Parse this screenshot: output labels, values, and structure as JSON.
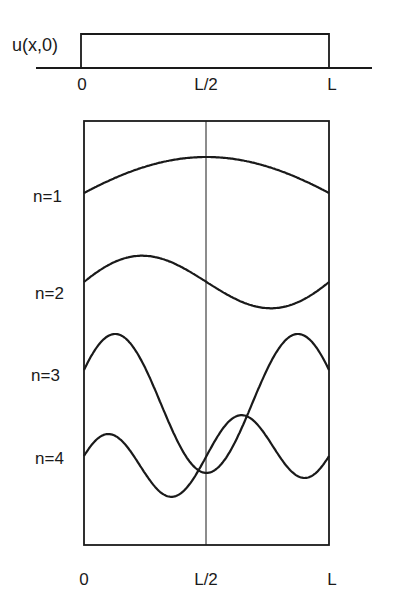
{
  "initial_condition": {
    "label": "u(x,0)",
    "ticks": [
      {
        "label": "0",
        "x": 82
      },
      {
        "label": "L/2",
        "x": 206
      },
      {
        "label": "L",
        "x": 331
      }
    ]
  },
  "modes": [
    {
      "label": "n=1",
      "n": 1,
      "baseline_y": 193
    },
    {
      "label": "n=2",
      "n": 2,
      "baseline_y": 282
    },
    {
      "label": "n=3",
      "n": 3,
      "baseline_y": 370
    },
    {
      "label": "n=4",
      "n": 4,
      "baseline_y": 456
    }
  ],
  "modes_axis": {
    "ticks": [
      {
        "label": "0",
        "x": 84
      },
      {
        "label": "L/2",
        "x": 206
      },
      {
        "label": "L",
        "x": 329
      }
    ]
  },
  "colors": {
    "ink": "#1a1a1a",
    "background": "#ffffff"
  }
}
